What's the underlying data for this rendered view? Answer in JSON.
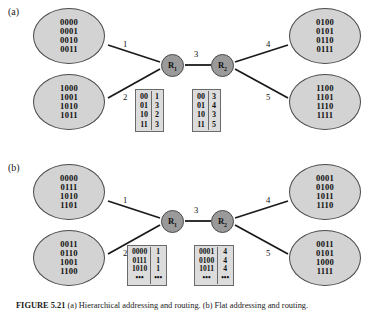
{
  "figure": {
    "caption_label": "FIGURE 5.21",
    "caption_text": "(a) Hierarchical addressing and routing. (b) Flat addressing and routing."
  },
  "panels": [
    {
      "id": "a",
      "label": "(a)",
      "hosts": [
        {
          "position": "top-left",
          "addresses": [
            "0000",
            "0001",
            "0010",
            "0011"
          ]
        },
        {
          "position": "bottom-left",
          "addresses": [
            "1000",
            "1001",
            "1010",
            "1011"
          ]
        },
        {
          "position": "top-right",
          "addresses": [
            "0100",
            "0101",
            "0110",
            "0111"
          ]
        },
        {
          "position": "bottom-right",
          "addresses": [
            "1100",
            "1101",
            "1110",
            "1111"
          ]
        }
      ],
      "routers": [
        {
          "name": "R",
          "subscript": "1"
        },
        {
          "name": "R",
          "subscript": "2"
        }
      ],
      "link_labels": [
        "1",
        "2",
        "3",
        "4",
        "5"
      ],
      "tables": [
        {
          "owner": "R1",
          "prefixes": [
            "00",
            "01",
            "10",
            "11"
          ],
          "outputs": [
            "1",
            "3",
            "2",
            "3"
          ]
        },
        {
          "owner": "R2",
          "prefixes": [
            "00",
            "01",
            "10",
            "11"
          ],
          "outputs": [
            "3",
            "4",
            "3",
            "5"
          ]
        }
      ]
    },
    {
      "id": "b",
      "label": "(b)",
      "hosts": [
        {
          "position": "top-left",
          "addresses": [
            "0000",
            "0111",
            "1010",
            "1101"
          ]
        },
        {
          "position": "bottom-left",
          "addresses": [
            "0011",
            "0110",
            "1001",
            "1100"
          ]
        },
        {
          "position": "top-right",
          "addresses": [
            "0001",
            "0100",
            "1011",
            "1110"
          ]
        },
        {
          "position": "bottom-right",
          "addresses": [
            "0011",
            "0101",
            "1000",
            "1111"
          ]
        }
      ],
      "routers": [
        {
          "name": "R",
          "subscript": "1"
        },
        {
          "name": "R",
          "subscript": "2"
        }
      ],
      "link_labels": [
        "1",
        "2",
        "3",
        "4",
        "5"
      ],
      "tables": [
        {
          "owner": "R1",
          "prefixes": [
            "0000",
            "0111",
            "1010",
            "•••"
          ],
          "outputs": [
            "1",
            "1",
            "1",
            "•••"
          ]
        },
        {
          "owner": "R2",
          "prefixes": [
            "0001",
            "0100",
            "1011",
            "•••"
          ],
          "outputs": [
            "4",
            "4",
            "4",
            "•••"
          ]
        }
      ]
    }
  ],
  "colors": {
    "host_fill": "#d3d3d3",
    "router_fill": "#9a9a9a",
    "stroke": "#4a4a4a",
    "table_fill": "#dcdcdc",
    "background": "#ffffff"
  }
}
